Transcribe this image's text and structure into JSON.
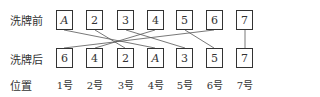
{
  "labels": {
    "before": "洗牌前",
    "after": "洗牌后",
    "position": "位置"
  },
  "before_cards": [
    "A",
    "2",
    "3",
    "4",
    "5",
    "6",
    "7"
  ],
  "after_cards": [
    "6",
    "4",
    "2",
    "A",
    "3",
    "5",
    "7"
  ],
  "positions": [
    "1号",
    "2号",
    "3号",
    "4号",
    "5号",
    "6号",
    "7号"
  ],
  "mapping": [
    {
      "card": "A",
      "from": 1,
      "to": 4
    },
    {
      "card": "2",
      "from": 2,
      "to": 3
    },
    {
      "card": "3",
      "from": 3,
      "to": 5
    },
    {
      "card": "4",
      "from": 4,
      "to": 2
    },
    {
      "card": "5",
      "from": 5,
      "to": 6
    },
    {
      "card": "6",
      "from": 6,
      "to": 1
    },
    {
      "card": "7",
      "from": 7,
      "to": 7
    }
  ]
}
